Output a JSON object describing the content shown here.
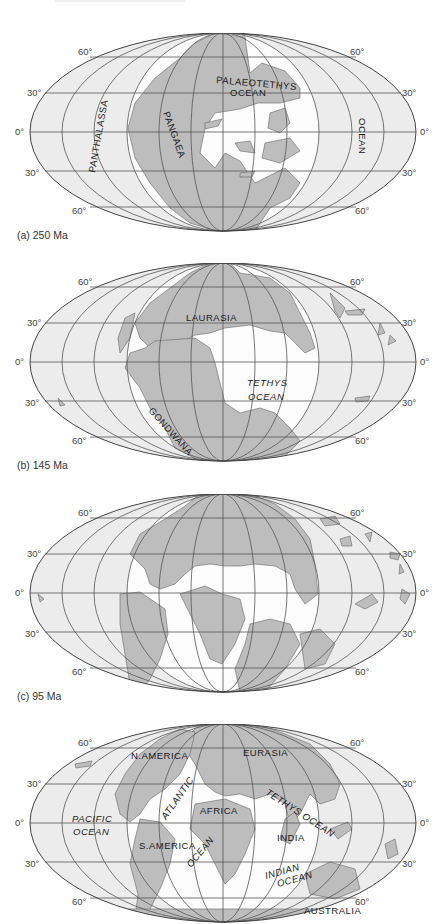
{
  "figure": {
    "title_cut_off": "",
    "colors": {
      "land": "#bdbdbd",
      "inner_ocean": "#fcfcfc",
      "outer_ocean": "#ececec",
      "grid": "#555555",
      "text": "#1a1a1a"
    },
    "latitude_labels": [
      "60°",
      "30°",
      "0°",
      "30°",
      "60°"
    ],
    "projection": "Mollweide/Hammer equal-area, 30° graticule",
    "panels": [
      {
        "id": "a",
        "caption": "(a)  250 Ma",
        "labels": [
          {
            "text": "PANTHALASSA",
            "style": "upright"
          },
          {
            "text": "PANGAEA",
            "style": "upright"
          },
          {
            "text": "PALAEOTETHYS",
            "style": "upright"
          },
          {
            "text": "OCEAN",
            "style": "upright"
          },
          {
            "text": "OCEAN",
            "style": "upright"
          }
        ]
      },
      {
        "id": "b",
        "caption": "(b)  145 Ma",
        "labels": [
          {
            "text": "LAURASIA",
            "style": "upright"
          },
          {
            "text": "TETHYS",
            "style": "italic"
          },
          {
            "text": "OCEAN",
            "style": "italic"
          },
          {
            "text": "GONDWANA",
            "style": "upright"
          }
        ]
      },
      {
        "id": "c",
        "caption": "(c)  95 Ma",
        "labels": []
      },
      {
        "id": "d",
        "caption": "",
        "labels": [
          {
            "text": "N.AMERICA",
            "style": "upright"
          },
          {
            "text": "EURASIA",
            "style": "upright"
          },
          {
            "text": "ATLANTIC",
            "style": "italic"
          },
          {
            "text": "TETHYS OCEAN",
            "style": "italic"
          },
          {
            "text": "PACIFIC",
            "style": "italic"
          },
          {
            "text": "OCEAN",
            "style": "italic"
          },
          {
            "text": "AFRICA",
            "style": "upright"
          },
          {
            "text": "INDIA",
            "style": "upright"
          },
          {
            "text": "S.AMERICA",
            "style": "upright"
          },
          {
            "text": "OCEAN",
            "style": "italic"
          },
          {
            "text": "INDIAN",
            "style": "italic"
          },
          {
            "text": "OCEAN",
            "style": "italic"
          },
          {
            "text": "AUSTRALIA",
            "style": "upright"
          }
        ]
      }
    ]
  }
}
